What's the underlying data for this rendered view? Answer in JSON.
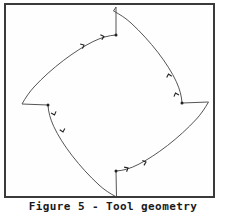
{
  "figure": {
    "caption": "Figure 5 - Tool geometry",
    "caption_label": "Figure 5",
    "caption_separator": "-",
    "caption_title": "Tool geometry",
    "frame": {
      "border_color": "#3a3a3a",
      "border_width_px": 2,
      "background": "#fefefe",
      "x": 4,
      "y": 3,
      "width": 211,
      "height": 195
    },
    "stroke_color": "#555555",
    "marker_color": "#222222",
    "background_color": "#ffffff"
  },
  "chart_data": {
    "type": "line",
    "title": "Tool geometry",
    "xlabel": "",
    "ylabel": "",
    "grid": false,
    "legend": "none",
    "xlim": [
      0,
      207
    ],
    "ylim": [
      0,
      191
    ],
    "symmetry_fold": 4,
    "center": [
      106,
      100
    ],
    "outline_path": "M 110 2 L 110 30 C 104 30 96 32 88 36 C 70 44 46 62 28 82 C 24 87 20 93 16 99 L 42 100 C 42 106 44 114 48 122 C 56 140 74 162 94 180 C 99 184 105 188 111 192 L 110 166 C 116 166 124 164 132 160 C 150 152 172 134 190 114 C 194 109 198 103 202 97 L 176 98 C 176 92 174 84 170 76 C 162 58 144 36 124 18 C 119 14 113 10 107 6 Z",
    "vertices": [
      {
        "name": "notch-top-inner",
        "x": 110,
        "y": 30
      },
      {
        "name": "notch-left-inner",
        "x": 42,
        "y": 100
      },
      {
        "name": "notch-bottom-inner",
        "x": 110,
        "y": 166
      },
      {
        "name": "notch-right-inner",
        "x": 176,
        "y": 98
      }
    ],
    "straight_segments": [
      {
        "name": "top-notch-flank",
        "from": [
          110,
          2
        ],
        "to": [
          110,
          30
        ],
        "orientation": "vertical"
      },
      {
        "name": "left-notch-flank",
        "from": [
          16,
          99
        ],
        "to": [
          42,
          100
        ],
        "orientation": "horizontal"
      },
      {
        "name": "bottom-notch-flank",
        "from": [
          110,
          166
        ],
        "to": [
          111,
          192
        ],
        "orientation": "vertical"
      },
      {
        "name": "right-notch-flank",
        "from": [
          176,
          98
        ],
        "to": [
          202,
          97
        ],
        "orientation": "horizontal"
      }
    ],
    "direction_markers": [
      {
        "name": "arrow-top-left-arc-a",
        "x": 78,
        "y": 40,
        "angle": -26
      },
      {
        "name": "arrow-top-left-arc-b",
        "x": 98,
        "y": 31,
        "angle": -16
      },
      {
        "name": "arrow-left-fillet",
        "x": 49,
        "y": 110,
        "angle": 70
      },
      {
        "name": "arrow-left-lower-arc",
        "x": 58,
        "y": 128,
        "angle": 74
      },
      {
        "name": "arrow-bottom-arc-a",
        "x": 122,
        "y": 163,
        "angle": -28
      },
      {
        "name": "arrow-bottom-arc-b",
        "x": 140,
        "y": 157,
        "angle": -18
      },
      {
        "name": "arrow-right-fillet",
        "x": 169,
        "y": 88,
        "angle": 68
      },
      {
        "name": "arrow-right-upper-arc",
        "x": 163,
        "y": 70,
        "angle": 74
      }
    ]
  }
}
